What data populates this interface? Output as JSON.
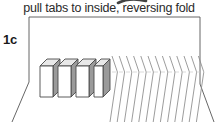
{
  "diagram": {
    "caption": "pull tabs to inside, reversing fold",
    "step_label": "1c",
    "colors": {
      "ink": "#2a2a2a",
      "outline": "#4a4a4a",
      "tab_side_fill": "#9a9a9a",
      "tab_top_fill": "#e8e8e8",
      "tab_front_fill": "#ffffff",
      "pleat_line": "#8a8a8a",
      "frame_line": "#555555",
      "arrow": "#222222",
      "background": "#ffffff"
    },
    "elements": {
      "arrow_name": "curved-arrow-fragment",
      "frame_name": "paper-sheet-frame",
      "tabs_name": "tab-group",
      "pleats_name": "accordion-pleat-group"
    },
    "tabs": {
      "count": 4,
      "labels": [
        "tab-1",
        "tab-2",
        "tab-3",
        "tab-4"
      ],
      "x_positions": [
        40,
        58,
        76,
        94
      ],
      "top": 59,
      "width": 13,
      "height": 38,
      "depth": 7
    },
    "pleats": {
      "count": 13,
      "start_x": 112,
      "spacing": 7.2,
      "top": 55,
      "bottom": 122
    },
    "frame": {
      "top_y": 17,
      "left_x": 29,
      "right_x": 200,
      "waist_y": 82,
      "bottom_left_x": 12,
      "bottom_right_x": 214,
      "bottom_y": 122
    }
  }
}
